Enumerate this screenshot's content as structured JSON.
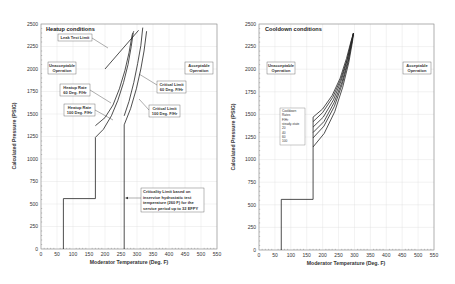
{
  "chart_data": [
    {
      "type": "line",
      "title": "Heatup conditions",
      "xlabel": "Moderator Temperature (Deg. F)",
      "ylabel": "Calculated Pressure (PSIG)",
      "xlim": [
        0,
        550
      ],
      "ylim": [
        0,
        2500
      ],
      "xticks": [
        0,
        50,
        100,
        150,
        200,
        250,
        300,
        350,
        400,
        450,
        500,
        550
      ],
      "yticks": [
        0,
        250,
        500,
        750,
        1000,
        1250,
        1500,
        1750,
        2000,
        2250,
        2500
      ],
      "grid": true,
      "series": [
        {
          "name": "Heatup Rate 100 Deg. F/Hr",
          "points": [
            [
              70,
              0
            ],
            [
              70,
              560
            ],
            [
              170,
              560
            ],
            [
              170,
              1240
            ],
            [
              195,
              1330
            ],
            [
              220,
              1480
            ],
            [
              240,
              1650
            ],
            [
              258,
              1850
            ],
            [
              272,
              2050
            ],
            [
              282,
              2250
            ],
            [
              288,
              2400
            ]
          ]
        },
        {
          "name": "Heatup Rate 60 Deg. F/Hr",
          "points": [
            [
              170,
              1370
            ],
            [
              200,
              1460
            ],
            [
              225,
              1600
            ],
            [
              245,
              1780
            ],
            [
              262,
              1980
            ],
            [
              275,
              2180
            ],
            [
              285,
              2380
            ],
            [
              290,
              2420
            ]
          ]
        },
        {
          "name": "Critical Limit 100 Deg. F/Hr",
          "points": [
            [
              260,
              0
            ],
            [
              260,
              1380
            ],
            [
              280,
              1560
            ],
            [
              298,
              1780
            ],
            [
              312,
              2000
            ],
            [
              322,
              2200
            ],
            [
              330,
              2420
            ]
          ]
        },
        {
          "name": "Critical Limit 60 Deg. F/Hr",
          "points": [
            [
              260,
              1480
            ],
            [
              275,
              1640
            ],
            [
              290,
              1850
            ],
            [
              302,
              2060
            ],
            [
              312,
              2260
            ],
            [
              318,
              2460
            ]
          ]
        },
        {
          "name": "Leak Test Limit",
          "points": [
            [
              200,
              2000
            ],
            [
              305,
              2430
            ]
          ]
        }
      ],
      "annotations": [
        {
          "text": "Leak Test Limit",
          "box": true
        },
        {
          "text": "Unacceptable Operation",
          "box": true
        },
        {
          "text": "Acceptable Operation",
          "box": true
        },
        {
          "text": "Heatup Rate 60 Deg. F/Hr",
          "box": true
        },
        {
          "text": "Heatup Rate 100 Deg. F/Hr",
          "box": true
        },
        {
          "text": "Critical Limit 60 Deg. F/Hr",
          "box": true
        },
        {
          "text": "Critical Limit 100 Deg. F/Hr",
          "box": true
        },
        {
          "text": "Criticality Limit based on inservice hydrostatic test temperature (260 F) for the service period up to 32 EFPY",
          "box": true
        }
      ]
    },
    {
      "type": "line",
      "title": "Cooldown conditions",
      "xlabel": "Moderator Temperature (Deg. F)",
      "ylabel": "Calculated Pressure (PSIG)",
      "xlim": [
        0,
        550
      ],
      "ylim": [
        0,
        2500
      ],
      "xticks": [
        0,
        50,
        100,
        150,
        200,
        250,
        300,
        350,
        400,
        450,
        500,
        550
      ],
      "yticks": [
        0,
        250,
        500,
        750,
        1000,
        1250,
        1500,
        1750,
        2000,
        2250,
        2500
      ],
      "grid": true,
      "series": [
        {
          "name": "steady-state",
          "points": [
            [
              70,
              0
            ],
            [
              70,
              560
            ],
            [
              170,
              560
            ],
            [
              170,
              1470
            ],
            [
              200,
              1560
            ],
            [
              230,
              1710
            ],
            [
              255,
              1900
            ],
            [
              275,
              2120
            ],
            [
              290,
              2320
            ],
            [
              297,
              2400
            ]
          ]
        },
        {
          "name": "20",
          "points": [
            [
              170,
              1420
            ],
            [
              200,
              1520
            ],
            [
              232,
              1690
            ],
            [
              257,
              1890
            ],
            [
              277,
              2110
            ],
            [
              291,
              2320
            ],
            [
              297,
              2400
            ]
          ]
        },
        {
          "name": "40",
          "points": [
            [
              170,
              1360
            ],
            [
              202,
              1470
            ],
            [
              234,
              1660
            ],
            [
              259,
              1880
            ],
            [
              278,
              2110
            ],
            [
              292,
              2320
            ],
            [
              297,
              2400
            ]
          ]
        },
        {
          "name": "60",
          "points": [
            [
              170,
              1300
            ],
            [
              204,
              1420
            ],
            [
              236,
              1630
            ],
            [
              261,
              1860
            ],
            [
              280,
              2100
            ],
            [
              293,
              2320
            ],
            [
              297,
              2400
            ]
          ]
        },
        {
          "name": "100",
          "points": [
            [
              170,
              1140
            ],
            [
              205,
              1290
            ],
            [
              238,
              1530
            ],
            [
              263,
              1800
            ],
            [
              282,
              2070
            ],
            [
              294,
              2310
            ],
            [
              297,
              2400
            ]
          ]
        },
        {
          "name": "mid",
          "points": [
            [
              170,
              1240
            ],
            [
              204,
              1370
            ],
            [
              237,
              1590
            ],
            [
              262,
              1840
            ],
            [
              281,
              2090
            ],
            [
              293,
              2320
            ],
            [
              297,
              2400
            ]
          ]
        }
      ],
      "legend": {
        "title": "Cooldown Rates F/Hr",
        "entries": [
          "steady-state",
          "20",
          "40",
          "60",
          "100"
        ]
      },
      "annotations": [
        {
          "text": "Unacceptable Operation",
          "box": true
        },
        {
          "text": "Acceptable Operation",
          "box": true
        }
      ]
    }
  ],
  "left": {
    "title": "Heatup conditions",
    "xlabel": "Moderator Temperature (Deg. F)",
    "ylabel": "Calculated Pressure (PSIG)",
    "leak_test": "Leak Test Limit",
    "unacceptable_1": "Unacceptable",
    "unacceptable_2": "Operation",
    "acceptable_1": "Acceptable",
    "acceptable_2": "Operation",
    "heatup60_1": "Heatup Rate",
    "heatup60_2": "60 Deg. F/Hr",
    "heatup100_1": "Heatup Rate",
    "heatup100_2": "100 Deg. F/Hr",
    "crit60_1": "Critical Limit",
    "crit60_2": "60 Deg. F/Hr",
    "crit100_1": "Critical Limit",
    "crit100_2": "100 Deg. F/Hr",
    "note_1": "Criticality Limit based on",
    "note_2": "inservice hydrostatic test",
    "note_3": "temperature (260 F) for the",
    "note_4": "service period up to 32 EFPY"
  },
  "right": {
    "title": "Cooldown conditions",
    "xlabel": "Moderator Temperature (Deg. F)",
    "ylabel": "Calculated Pressure (PSIG)",
    "unacceptable_1": "Unacceptable",
    "unacceptable_2": "Operation",
    "acceptable_1": "Acceptable",
    "acceptable_2": "Operation",
    "legend": [
      "Cooldown",
      "Rates",
      "F/Hr",
      "steady-state",
      "20",
      "40",
      "60",
      "100"
    ]
  },
  "ticks": {
    "x": [
      "0",
      "50",
      "100",
      "150",
      "200",
      "250",
      "300",
      "350",
      "400",
      "450",
      "500",
      "550"
    ],
    "y": [
      "0",
      "250",
      "500",
      "750",
      "1000",
      "1250",
      "1500",
      "1750",
      "2000",
      "2250",
      "2500"
    ]
  }
}
